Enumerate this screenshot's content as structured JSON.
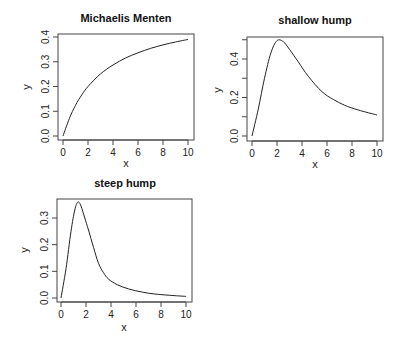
{
  "chart_data": [
    {
      "type": "line",
      "title": "Michaelis Menten",
      "xlabel": "x",
      "ylabel": "y",
      "xlim": [
        0,
        10
      ],
      "ylim": [
        0.0,
        0.4
      ],
      "xticks": [
        "0",
        "2",
        "4",
        "6",
        "8",
        "10"
      ],
      "yticks": [
        "0.0",
        "0.1",
        "0.2",
        "0.3",
        "0.4"
      ],
      "grid": false,
      "x": [
        0,
        0.5,
        1,
        1.5,
        2,
        3,
        4,
        5,
        6,
        7,
        8,
        9,
        10
      ],
      "y": [
        0,
        0.07,
        0.124,
        0.166,
        0.2,
        0.251,
        0.287,
        0.315,
        0.336,
        0.354,
        0.368,
        0.38,
        0.39
      ],
      "box": {
        "left": 58,
        "top": 34,
        "right": 194,
        "bottom": 140
      },
      "xpx": [
        63,
        188
      ],
      "ypx": [
        136,
        37
      ],
      "title_pos": [
        126,
        22
      ],
      "xlabel_pos": [
        126,
        167
      ],
      "ylabel_pos": [
        30,
        87
      ]
    },
    {
      "type": "line",
      "title": "shallow hump",
      "xlabel": "x",
      "ylabel": "y",
      "xlim": [
        0,
        10
      ],
      "ylim": [
        0.0,
        0.5
      ],
      "xticks": [
        "0",
        "2",
        "4",
        "6",
        "8",
        "10"
      ],
      "yticks": [
        "0.0",
        "0.2",
        "0.4"
      ],
      "minor_yticks": [
        0.1,
        0.3,
        0.5
      ],
      "grid": false,
      "x": [
        0,
        0.5,
        1,
        1.5,
        2,
        2.5,
        3,
        3.7,
        4.5,
        5.6,
        6.5,
        7.4,
        8.5,
        10
      ],
      "y": [
        0,
        0.14,
        0.3,
        0.43,
        0.495,
        0.49,
        0.45,
        0.385,
        0.31,
        0.23,
        0.19,
        0.16,
        0.135,
        0.109
      ],
      "box": {
        "left": 247,
        "top": 37,
        "right": 383,
        "bottom": 141
      },
      "xpx": [
        252,
        377
      ],
      "ypx": [
        136,
        59
      ],
      "title_pos": [
        315,
        24
      ],
      "xlabel_pos": [
        315,
        168
      ],
      "ylabel_pos": [
        221,
        90
      ]
    },
    {
      "type": "line",
      "title": "steep hump",
      "xlabel": "x",
      "ylabel": "y",
      "xlim": [
        0,
        10
      ],
      "ylim": [
        0.0,
        0.35
      ],
      "xticks": [
        "0",
        "2",
        "4",
        "6",
        "8",
        "10"
      ],
      "yticks": [
        "0.0",
        "0.1",
        "0.2",
        "0.3"
      ],
      "grid": false,
      "x": [
        0,
        0.4,
        0.8,
        1.1,
        1.35,
        1.6,
        1.9,
        2.2,
        2.6,
        3.0,
        3.4,
        3.8,
        4.5,
        5.4,
        6.5,
        7.5,
        8.7,
        10
      ],
      "y": [
        0,
        0.11,
        0.25,
        0.33,
        0.36,
        0.345,
        0.3,
        0.255,
        0.19,
        0.13,
        0.095,
        0.071,
        0.05,
        0.034,
        0.022,
        0.015,
        0.01,
        0.006
      ],
      "box": {
        "left": 57,
        "top": 199,
        "right": 192,
        "bottom": 302
      },
      "xpx": [
        61,
        186
      ],
      "ypx": [
        298,
        218
      ],
      "yref": [
        0.0,
        0.3
      ],
      "title_pos": [
        125,
        187
      ],
      "xlabel_pos": [
        124,
        331
      ],
      "ylabel_pos": [
        28,
        250
      ]
    }
  ]
}
